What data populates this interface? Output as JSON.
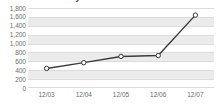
{
  "chart_data": {
    "type": "line",
    "title": "Revenue History",
    "xlabel": "",
    "ylabel": "",
    "categories": [
      "12/03",
      "12/04",
      "12/05",
      "12/06",
      "12/07"
    ],
    "values": [
      440,
      570,
      710,
      730,
      1640
    ],
    "series": [
      {
        "name": "Revenue",
        "values": [
          440,
          570,
          710,
          730,
          1640
        ]
      }
    ],
    "ylim": [
      0,
      1800
    ],
    "y_ticks": [
      1800,
      1600,
      1400,
      1200,
      1000,
      800,
      600,
      400,
      200,
      0
    ],
    "y_tick_labels": [
      "1,800",
      "1,600",
      "1,400",
      "1,200",
      "1,000",
      "800",
      "600",
      "400",
      "200",
      "0"
    ],
    "grid": true,
    "legend": false,
    "legend_position": "none",
    "marker": "open-circle",
    "colors": {
      "line": "#3a3a3a",
      "marker_fill": "#ffffff",
      "marker_stroke": "#3a3a3a",
      "band": "#ebebeb",
      "gridline": "#dcdcdc",
      "plot_background": "#ffffff",
      "tick_text": "#6b6b6b",
      "title_text": "#4a4a4a"
    }
  }
}
